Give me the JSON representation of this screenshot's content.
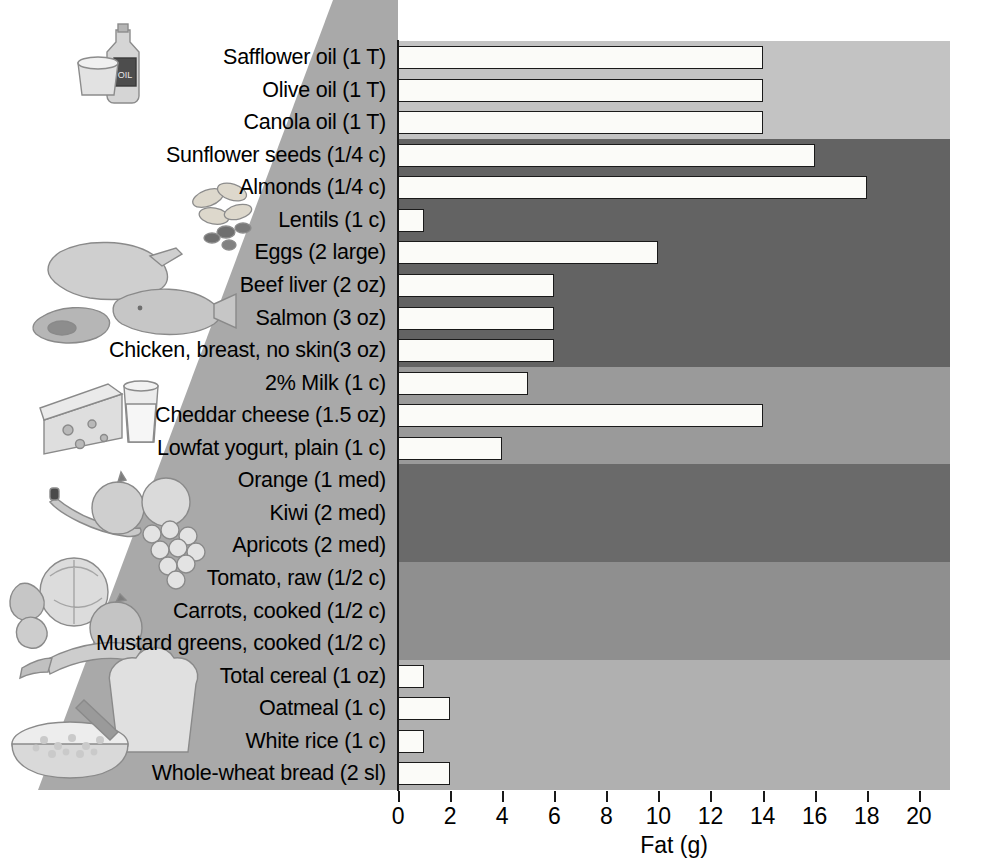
{
  "chart_data": {
    "type": "bar",
    "orientation": "horizontal",
    "title": "",
    "xlabel": "Fat (g)",
    "ylabel": "",
    "xlim": [
      0,
      21.2
    ],
    "xticks": [
      0,
      2,
      4,
      6,
      8,
      10,
      12,
      14,
      16,
      18,
      20
    ],
    "grid": false,
    "legend": "none",
    "categories": [
      "Safflower oil (1 T)",
      "Olive oil (1 T)",
      "Canola oil (1 T)",
      "Sunflower seeds (1/4 c)",
      "Almonds (1/4 c)",
      "Lentils (1 c)",
      "Eggs (2 large)",
      "Beef liver (2 oz)",
      "Salmon (3 oz)",
      "Chicken, breast, no skin(3 oz)",
      "2% Milk (1 c)",
      "Cheddar cheese (1.5 oz)",
      "Lowfat yogurt, plain (1 c)",
      "Orange (1 med)",
      "Kiwi (2 med)",
      "Apricots (2 med)",
      "Tomato, raw (1/2 c)",
      "Carrots, cooked (1/2 c)",
      "Mustard greens, cooked (1/2 c)",
      "Total cereal (1 oz)",
      "Oatmeal (1 c)",
      "White rice (1 c)",
      "Whole-wheat bread (2 sl)"
    ],
    "values": [
      14,
      14,
      14,
      16,
      18,
      1,
      10,
      6,
      6,
      6,
      5,
      14,
      4,
      0,
      0,
      0,
      0,
      0,
      0,
      1,
      2,
      1,
      2
    ]
  },
  "bands": [
    {
      "name": "fats-oils",
      "start_index": 0,
      "end_index": 2,
      "color": "#c3c3c3"
    },
    {
      "name": "nuts-seeds-legumes-protein",
      "start_index": 3,
      "end_index": 9,
      "color": "#636363"
    },
    {
      "name": "dairy",
      "start_index": 10,
      "end_index": 12,
      "color": "#9a9a9a"
    },
    {
      "name": "fruits",
      "start_index": 13,
      "end_index": 15,
      "color": "#6a6a6a"
    },
    {
      "name": "vegetables",
      "start_index": 16,
      "end_index": 18,
      "color": "#8f8f8f"
    },
    {
      "name": "grains",
      "start_index": 19,
      "end_index": 22,
      "color": "#b0b0b0"
    }
  ],
  "illustrations": [
    {
      "name": "oil-bottle-and-butter-tub",
      "group": "fats-oils"
    },
    {
      "name": "nuts-and-seeds",
      "group": "nuts-seeds"
    },
    {
      "name": "poultry-fish-and-meat",
      "group": "protein"
    },
    {
      "name": "cheese-wedge-and-milk-glass",
      "group": "dairy"
    },
    {
      "name": "fruit-assortment",
      "group": "fruits"
    },
    {
      "name": "vegetable-assortment",
      "group": "vegetables"
    },
    {
      "name": "bread-slice-and-oatmeal-bowl",
      "group": "grains"
    }
  ],
  "colors": {
    "bar_fill": "#fbfbf8",
    "bar_stroke": "#1a1a1a",
    "axis": "#1a1a1a",
    "wedge_fill": "#a9a9a9",
    "page_background": "#ffffff"
  }
}
